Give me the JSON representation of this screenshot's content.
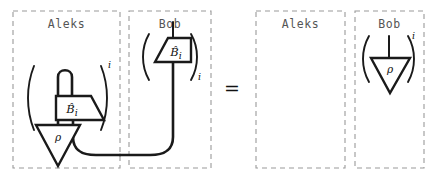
{
  "figure": {
    "kind": "string-diagram-equation",
    "relation": "=",
    "colors": {
      "ink": "#1a1a1a",
      "frame_dashed": "#9a9a9a",
      "party_label": "#555555",
      "background": "#ffffff"
    }
  },
  "left_side": {
    "aleks": {
      "party": "Aleks",
      "superscript": "i",
      "gate_label": "B",
      "gate_hat": "̂",
      "gate_subscript": "i",
      "state_label": "ρ"
    },
    "bob": {
      "party": "Bob",
      "superscript": "i",
      "gate_label": "B",
      "gate_hat": "̂",
      "gate_subscript": "i"
    }
  },
  "right_side": {
    "aleks": {
      "party": "Aleks",
      "empty": true
    },
    "bob": {
      "party": "Bob",
      "superscript": "i",
      "state_label": "ρ"
    }
  }
}
